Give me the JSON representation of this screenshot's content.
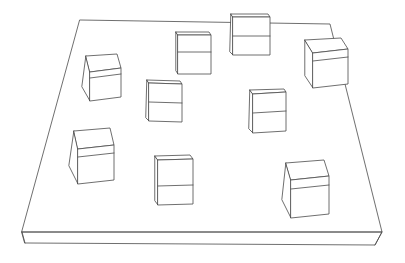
{
  "scene": {
    "title": "3D wireframe line drawing",
    "description": "Thin rectangular slab platform drawn in perspective with nine hollow wireframe cubes resting on its top surface",
    "width": 405,
    "height": 263,
    "background_color": "#ffffff",
    "line_color": "#4a4a4a",
    "line_width": 0.8,
    "projection": "perspective",
    "object_count": 10,
    "cube_count": 9
  },
  "slab": {
    "name": "ground-platform",
    "label": "Rectangular slab",
    "thickness_px": 12,
    "top_face_points": "80,20 330,24 382,232 22,232",
    "front_face_points": "22,232 382,232 375,245 25,243",
    "left_edge": "22,232 25,243",
    "right_edge": "382,232 375,245",
    "corners": {
      "back_left": [
        80,
        20
      ],
      "back_right": [
        330,
        24
      ],
      "front_right": [
        382,
        232
      ],
      "front_left": [
        22,
        232
      ]
    }
  },
  "cubes": [
    {
      "id": "cube-1",
      "label": "Cube back-center (straddling back edge)",
      "position": {
        "x": 228,
        "y": 12
      },
      "size": 43,
      "orientation": "near-edge-on",
      "top_face": "231,14 268,14 270,17 233,17",
      "front_face": "233,17 270,17 270,55 233,55",
      "side_face": "231,14 233,17 233,55 230,52",
      "divider": "233,36 270,36",
      "overlaps_slab_edge": true
    },
    {
      "id": "cube-2",
      "label": "Cube upper-middle-left",
      "position": {
        "x": 176,
        "y": 32
      },
      "size": 33,
      "orientation": "near-edge-on",
      "top_face": "176,32 209,32 211,35 178,35",
      "front_face": "178,35 211,35 211,74 178,74",
      "side_face": "176,32 178,35 178,74 176,71",
      "divider": "178,52 211,52",
      "overlaps_slab_edge": false
    },
    {
      "id": "cube-3",
      "label": "Cube upper-right",
      "position": {
        "x": 302,
        "y": 38
      },
      "size": 40,
      "orientation": "three-quarter",
      "top_face": "305,40 341,38 348,49 313,53",
      "front_face": "313,53 348,49 348,84 313,88",
      "side_face": "305,40 313,53 313,88 305,76",
      "divider": "313,61 348,57",
      "overlaps_slab_edge": true
    },
    {
      "id": "cube-4",
      "label": "Cube left-upper",
      "position": {
        "x": 81,
        "y": 54
      },
      "size": 38,
      "orientation": "three-quarter",
      "top_face": "86,56 117,54 121,68 90,72",
      "front_face": "90,72 121,68 121,97 90,101",
      "side_face": "86,56 90,72 90,101 82,87",
      "divider": "90,78 121,74",
      "overlaps_slab_edge": false
    },
    {
      "id": "cube-5",
      "label": "Cube center-left",
      "position": {
        "x": 146,
        "y": 80
      },
      "size": 35,
      "orientation": "near-edge-on",
      "top_face": "147,80 180,81 182,84 149,83",
      "front_face": "149,83 182,84 182,122 149,121",
      "side_face": "147,80 149,83 149,121 146,118",
      "divider": "149,102 182,103",
      "overlaps_slab_edge": false
    },
    {
      "id": "cube-6",
      "label": "Cube center-right",
      "position": {
        "x": 248,
        "y": 89
      },
      "size": 36,
      "orientation": "near-edge-on",
      "top_face": "250,90 284,89 286,92 253,94",
      "front_face": "253,94 286,92 286,131 253,133",
      "side_face": "250,90 253,94 253,133 249,129",
      "divider": "253,113 286,111",
      "overlaps_slab_edge": false
    },
    {
      "id": "cube-7",
      "label": "Cube lower-left",
      "position": {
        "x": 68,
        "y": 128
      },
      "size": 43,
      "orientation": "three-quarter",
      "top_face": "74,131 110,128 114,145 78,149",
      "front_face": "78,149 114,145 114,180 78,184",
      "side_face": "74,131 78,149 78,184 69,166",
      "divider": "78,157 114,153",
      "overlaps_slab_edge": false
    },
    {
      "id": "cube-8",
      "label": "Cube bottom-center",
      "position": {
        "x": 154,
        "y": 155
      },
      "size": 40,
      "orientation": "near-edge-on",
      "top_face": "155,156 190,155 193,159 158,160",
      "front_face": "158,160 193,159 193,204 158,205",
      "side_face": "155,156 158,160 158,205 155,201",
      "divider": "158,186 193,185",
      "overlaps_slab_edge": false
    },
    {
      "id": "cube-9",
      "label": "Cube bottom-right",
      "position": {
        "x": 281,
        "y": 160
      },
      "size": 43,
      "orientation": "three-quarter",
      "top_face": "286,163 324,160 329,176 291,180",
      "front_face": "291,180 329,176 329,214 291,218",
      "side_face": "286,163 291,180 291,218 282,200",
      "divider": "291,189 329,185",
      "overlaps_slab_edge": false
    }
  ]
}
